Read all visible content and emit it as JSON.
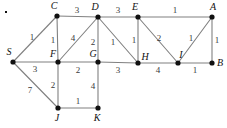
{
  "figure": {
    "width": 227,
    "height": 128,
    "background_color": "#ffffff",
    "edge_color": "#808080",
    "node_color": "#111111",
    "label_color": "#111111",
    "weight_color": "#3a3a3a"
  },
  "corner_mark": {
    "present": true,
    "x": 5,
    "y": 11
  },
  "nodes": [
    {
      "id": "S",
      "label": "S",
      "x": 13,
      "y": 62,
      "label_x": 9,
      "label_y": 52
    },
    {
      "id": "C",
      "label": "C",
      "x": 57,
      "y": 16,
      "label_x": 54,
      "label_y": 6
    },
    {
      "id": "D",
      "label": "D",
      "x": 98,
      "y": 17,
      "label_x": 95,
      "label_y": 7
    },
    {
      "id": "E",
      "label": "E",
      "x": 138,
      "y": 17,
      "label_x": 135,
      "label_y": 7
    },
    {
      "id": "A",
      "label": "A",
      "x": 212,
      "y": 17,
      "label_x": 213,
      "label_y": 7
    },
    {
      "id": "F",
      "label": "F",
      "x": 58,
      "y": 62,
      "label_x": 53,
      "label_y": 54
    },
    {
      "id": "G",
      "label": "G",
      "x": 98,
      "y": 62,
      "label_x": 93,
      "label_y": 54
    },
    {
      "id": "H",
      "label": "H",
      "x": 138,
      "y": 63,
      "label_x": 145,
      "label_y": 57
    },
    {
      "id": "I",
      "label": "I",
      "x": 178,
      "y": 63,
      "label_x": 181,
      "label_y": 55
    },
    {
      "id": "B",
      "label": "B",
      "x": 212,
      "y": 63,
      "label_x": 220,
      "label_y": 63
    },
    {
      "id": "J",
      "label": "J",
      "x": 58,
      "y": 108,
      "label_x": 57,
      "label_y": 118
    },
    {
      "id": "K",
      "label": "K",
      "x": 98,
      "y": 108,
      "label_x": 97,
      "label_y": 118
    }
  ],
  "edges": [
    {
      "from": "S",
      "to": "C",
      "weight": "1",
      "wx": 32,
      "wy": 37
    },
    {
      "from": "S",
      "to": "F",
      "weight": "3",
      "wx": 35,
      "wy": 69
    },
    {
      "from": "S",
      "to": "J",
      "weight": "7",
      "wx": 30,
      "wy": 90
    },
    {
      "from": "C",
      "to": "D",
      "weight": "3",
      "wx": 77,
      "wy": 10
    },
    {
      "from": "C",
      "to": "F",
      "weight": "1",
      "wx": 53,
      "wy": 40
    },
    {
      "from": "F",
      "to": "D",
      "weight": "4",
      "wx": 73,
      "wy": 38
    },
    {
      "from": "F",
      "to": "G",
      "weight": "2",
      "wx": 78,
      "wy": 70
    },
    {
      "from": "F",
      "to": "J",
      "weight": "2",
      "wx": 53,
      "wy": 85
    },
    {
      "from": "D",
      "to": "E",
      "weight": "3",
      "wx": 118,
      "wy": 10
    },
    {
      "from": "D",
      "to": "G",
      "weight": "2",
      "wx": 93,
      "wy": 42
    },
    {
      "from": "D",
      "to": "H",
      "weight": "1",
      "wx": 113,
      "wy": 42
    },
    {
      "from": "G",
      "to": "H",
      "weight": "3",
      "wx": 118,
      "wy": 70
    },
    {
      "from": "G",
      "to": "K",
      "weight": "4",
      "wx": 93,
      "wy": 86
    },
    {
      "from": "J",
      "to": "K",
      "weight": "1",
      "wx": 78,
      "wy": 101
    },
    {
      "from": "E",
      "to": "A",
      "weight": "1",
      "wx": 175,
      "wy": 10
    },
    {
      "from": "E",
      "to": "H",
      "weight": "1",
      "wx": 134,
      "wy": 40
    },
    {
      "from": "E",
      "to": "I",
      "weight": "2",
      "wx": 159,
      "wy": 38
    },
    {
      "from": "H",
      "to": "I",
      "weight": "4",
      "wx": 158,
      "wy": 70
    },
    {
      "from": "I",
      "to": "A",
      "weight": "1",
      "wx": 191,
      "wy": 38
    },
    {
      "from": "I",
      "to": "B",
      "weight": "1",
      "wx": 195,
      "wy": 70
    },
    {
      "from": "A",
      "to": "B",
      "weight": "1",
      "wx": 217,
      "wy": 40
    }
  ]
}
